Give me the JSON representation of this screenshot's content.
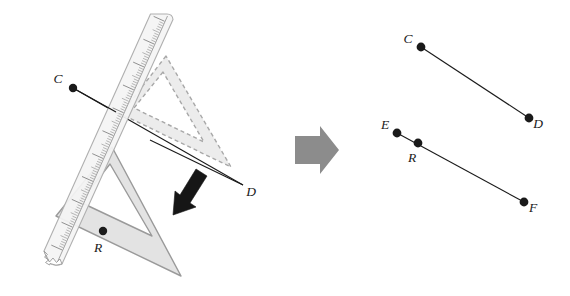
{
  "figure": {
    "background_color": "#ffffff"
  },
  "colors": {
    "ink": "#1a1a1a",
    "tool_fill": "#e3e3e3",
    "tool_stroke": "#9a9a9a",
    "tool_fill_ghost": "#ededed",
    "tool_stroke_ghost": "#a8a8a8",
    "ruler_fill": "#f2f2f2",
    "ruler_stroke": "#b0b0b0",
    "tick": "#8a8a8a",
    "ruler_number": "#6e6e6e",
    "block_arrow": "#8c8c8c",
    "slide_arrow": "#1a1a1a",
    "point": "#1a1a1a"
  },
  "left_panel": {
    "name": "construction-panel",
    "description": "Ruler aligned along segment CD with a set square being slid down from the dashed ghost position to the solid position at point R",
    "ruler": {
      "name": "ruler",
      "numbers": [
        "0",
        "1",
        "2",
        "3",
        "4",
        "5",
        "6",
        "7",
        "8",
        "9",
        "10"
      ],
      "torn_edge": true
    },
    "set_square_ghost": {
      "name": "set-square-ghost",
      "style": "dashed",
      "label": ""
    },
    "set_square_solid": {
      "name": "set-square-solid",
      "style": "solid",
      "label": ""
    },
    "slide_arrow": {
      "name": "slide-arrow",
      "direction": "down-left"
    },
    "points": [
      {
        "id": "C",
        "label": "C",
        "x": 73,
        "y": 88,
        "label_x": 58,
        "label_y": 83
      },
      {
        "id": "D",
        "label": "D",
        "x": 243,
        "y": 185,
        "label_x": 251,
        "label_y": 196
      },
      {
        "id": "R",
        "label": "R",
        "x": 103,
        "y": 231,
        "label_x": 98,
        "label_y": 252
      }
    ],
    "segments": [
      {
        "id": "CD",
        "from": "C",
        "to": "D"
      }
    ]
  },
  "block_arrow": {
    "name": "result-arrow",
    "direction": "right"
  },
  "right_panel": {
    "name": "result-panel",
    "description": "Resulting parallel segments CD and EF with point R on EF",
    "points": [
      {
        "id": "C",
        "label": "C",
        "x": 421,
        "y": 47,
        "label_x": 408,
        "label_y": 43
      },
      {
        "id": "D",
        "label": "D",
        "x": 529,
        "y": 118,
        "label_x": 537,
        "label_y": 128
      },
      {
        "id": "E",
        "label": "E",
        "x": 397,
        "y": 133,
        "label_x": 384,
        "label_y": 129
      },
      {
        "id": "R",
        "label": "R",
        "x": 418,
        "y": 143,
        "label_x": 412,
        "label_y": 161
      },
      {
        "id": "F",
        "label": "F",
        "x": 524,
        "y": 202,
        "label_x": 532,
        "label_y": 212
      }
    ],
    "segments": [
      {
        "id": "CD",
        "from": "C",
        "to": "D"
      },
      {
        "id": "EF",
        "from": "E",
        "to": "F"
      }
    ]
  }
}
